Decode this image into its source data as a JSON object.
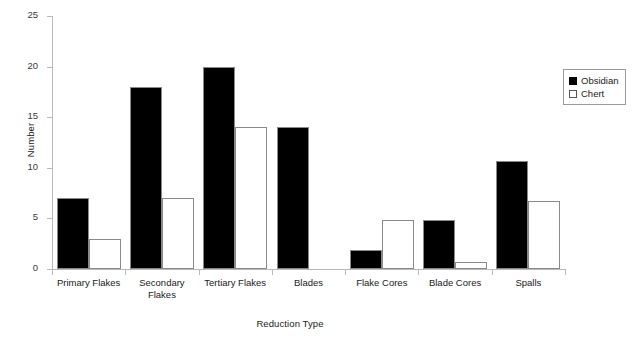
{
  "chart_data": {
    "type": "bar",
    "title": "",
    "xlabel": "Reduction Type",
    "ylabel": "Number",
    "ylim": [
      0,
      25
    ],
    "yticks": [
      0,
      5,
      10,
      15,
      20,
      25
    ],
    "ytick_labels": [
      "0",
      "5",
      "10",
      "15",
      "20",
      "25"
    ],
    "grid": false,
    "legend_position": "right",
    "categories": [
      "Primary Flakes",
      "Secondary\nFlakes",
      "Tertiary Flakes",
      "Blades",
      "Flake Cores",
      "Blade Cores",
      "Spalls"
    ],
    "series": [
      {
        "name": "Obsidian",
        "color": "#000000",
        "values": [
          7,
          18,
          20,
          14,
          1.9,
          4.8,
          10.7
        ]
      },
      {
        "name": "Chert",
        "color": "#ffffff",
        "values": [
          3,
          7,
          14,
          0,
          4.8,
          0.7,
          6.7
        ]
      }
    ]
  },
  "legend": {
    "items": [
      {
        "label": "Obsidian",
        "swatch": "black-square-icon"
      },
      {
        "label": "Chert",
        "swatch": "white-square-icon"
      }
    ]
  }
}
